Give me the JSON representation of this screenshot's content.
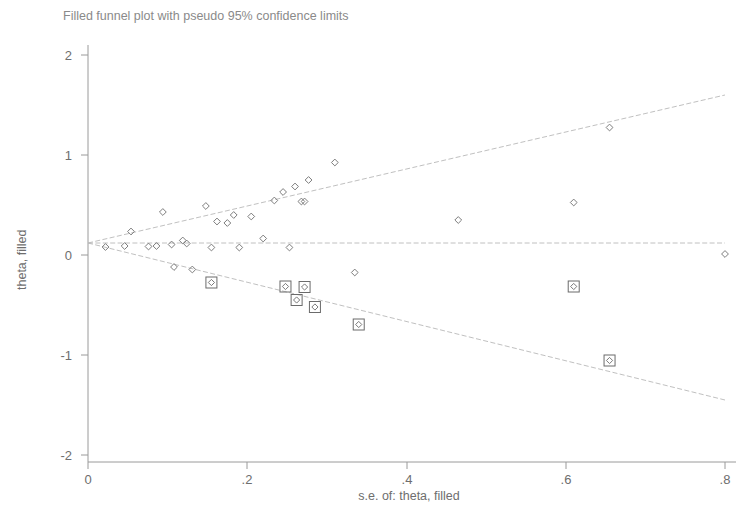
{
  "title": "Filled funnel plot with pseudo 95% confidence limits",
  "axes": {
    "xlabel": "s.e. of: theta, filled",
    "ylabel": "theta, filled",
    "xticks": [
      "0",
      ".2",
      ".4",
      ".6",
      ".8"
    ],
    "yticks": [
      "2",
      "1",
      "0",
      "-1",
      "-2"
    ]
  },
  "colors": {
    "background": "#ffffff",
    "axis": "#9a9a9a",
    "text": "#6e6e6e",
    "title": "#8a8a8a",
    "marker": "#7d7d7d",
    "imputed_marker": "#6b6b6b",
    "funnel_line": "#b9b9b9"
  },
  "chart_data": {
    "type": "scatter",
    "title": "Filled funnel plot with pseudo 95% confidence limits",
    "xlabel": "s.e. of: theta, filled",
    "ylabel": "theta, filled",
    "xlim": [
      0,
      0.8
    ],
    "ylim": [
      -2.3,
      2.3
    ],
    "xtick_values": [
      0,
      0.2,
      0.4,
      0.6,
      0.8
    ],
    "ytick_values": [
      2,
      1,
      0,
      -1,
      -2
    ],
    "grid": false,
    "legend": "none",
    "pooled_effect": 0.12,
    "reference_line": {
      "name": "pooled effect",
      "y": 0.12,
      "style": "dashed"
    },
    "funnel_limits": {
      "name": "pseudo 95% confidence limits",
      "style": "dashed",
      "apex": [
        0.0,
        0.12
      ],
      "upper_end": [
        0.8,
        1.6
      ],
      "lower_end": [
        0.8,
        -1.45
      ]
    },
    "series": [
      {
        "name": "observed studies",
        "marker": "open-diamond",
        "points": [
          [
            0.022,
            0.08
          ],
          [
            0.046,
            0.09
          ],
          [
            0.054,
            0.235
          ],
          [
            0.076,
            0.085
          ],
          [
            0.086,
            0.09
          ],
          [
            0.094,
            0.43
          ],
          [
            0.105,
            0.105
          ],
          [
            0.108,
            -0.12
          ],
          [
            0.119,
            0.145
          ],
          [
            0.124,
            0.115
          ],
          [
            0.131,
            -0.145
          ],
          [
            0.148,
            0.49
          ],
          [
            0.155,
            0.075
          ],
          [
            0.162,
            0.335
          ],
          [
            0.175,
            0.32
          ],
          [
            0.183,
            0.4
          ],
          [
            0.19,
            0.075
          ],
          [
            0.205,
            0.385
          ],
          [
            0.22,
            0.165
          ],
          [
            0.234,
            0.545
          ],
          [
            0.245,
            0.63
          ],
          [
            0.253,
            0.075
          ],
          [
            0.26,
            0.685
          ],
          [
            0.268,
            0.535
          ],
          [
            0.272,
            0.535
          ],
          [
            0.277,
            0.75
          ],
          [
            0.31,
            0.925
          ],
          [
            0.335,
            -0.175
          ],
          [
            0.465,
            0.35
          ],
          [
            0.61,
            0.525
          ],
          [
            0.655,
            1.275
          ],
          [
            0.8,
            0.01
          ]
        ]
      },
      {
        "name": "imputed (filled) studies",
        "marker": "boxed-diamond",
        "points": [
          [
            0.155,
            -0.275
          ],
          [
            0.248,
            -0.315
          ],
          [
            0.262,
            -0.45
          ],
          [
            0.272,
            -0.32
          ],
          [
            0.285,
            -0.52
          ],
          [
            0.34,
            -0.695
          ],
          [
            0.61,
            -0.315
          ],
          [
            0.655,
            -1.055
          ]
        ]
      }
    ]
  }
}
